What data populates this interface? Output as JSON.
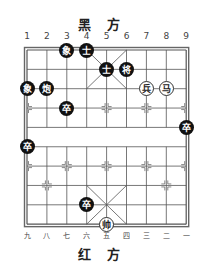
{
  "header": {
    "black_side": "黑 方"
  },
  "footer": {
    "red_side": "红 方"
  },
  "top_file_labels": [
    "1",
    "2",
    "3",
    "4",
    "5",
    "6",
    "7",
    "8",
    "9"
  ],
  "bottom_file_labels": [
    "九",
    "八",
    "七",
    "六",
    "五",
    "四",
    "三",
    "二",
    "一"
  ],
  "colors": {
    "black_piece": "#111111",
    "red_piece_bg": "#ffffff",
    "grid": "#555555"
  },
  "pieces": [
    {
      "side": "black",
      "char": "象",
      "file": 3,
      "rank": 0
    },
    {
      "side": "black",
      "char": "士",
      "file": 4,
      "rank": 0
    },
    {
      "side": "black",
      "char": "士",
      "file": 5,
      "rank": 1
    },
    {
      "side": "black",
      "char": "将",
      "file": 6,
      "rank": 1
    },
    {
      "side": "black",
      "char": "象",
      "file": 1,
      "rank": 2
    },
    {
      "side": "black",
      "char": "炮",
      "file": 2,
      "rank": 2
    },
    {
      "side": "red",
      "char": "兵",
      "file": 7,
      "rank": 2
    },
    {
      "side": "red",
      "char": "马",
      "file": 8,
      "rank": 2
    },
    {
      "side": "black",
      "char": "卒",
      "file": 3,
      "rank": 3
    },
    {
      "side": "black",
      "char": "卒",
      "file": 9,
      "rank": 4
    },
    {
      "side": "black",
      "char": "卒",
      "file": 1,
      "rank": 5
    },
    {
      "side": "black",
      "char": "卒",
      "file": 4,
      "rank": 8
    },
    {
      "side": "red",
      "char": "帅",
      "file": 5,
      "rank": 9
    }
  ]
}
